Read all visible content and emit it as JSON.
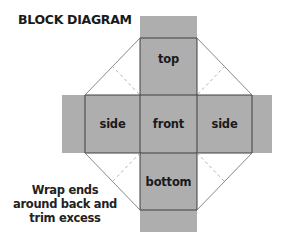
{
  "title": "BLOCK DIAGRAM",
  "colors": {
    "panel_fill": "#aeaeae",
    "fold_line": "#3e3e3e",
    "cut_line": "#6a6a6a",
    "dashed_line": "#9a9a9a",
    "background": "#ffffff"
  },
  "panels": {
    "top": "top",
    "left_side": "side",
    "front": "front",
    "right_side": "side",
    "bottom": "bottom"
  },
  "caption": {
    "lines": [
      "Wrap ends",
      "around back and",
      "trim excess"
    ]
  }
}
